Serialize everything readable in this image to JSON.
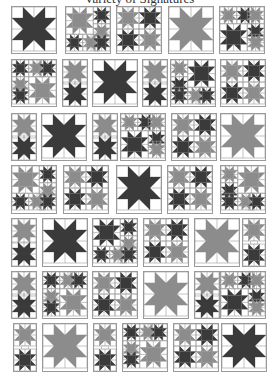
{
  "page": {
    "title": "Variety of Signatures",
    "colors": {
      "dark": "#3a3a3a",
      "medium": "#8c8c8c",
      "light": "#ffffff",
      "grid": "#9a9a9a"
    }
  },
  "blocks": [
    {
      "x": 12,
      "y": 7,
      "w": 44,
      "h": 46,
      "kind": "big",
      "fill": "dark"
    },
    {
      "x": 66,
      "y": 7,
      "w": 44,
      "h": 46,
      "kind": "mixA",
      "fill": "medium"
    },
    {
      "x": 117,
      "y": 7,
      "w": 44,
      "h": 46,
      "kind": "four",
      "fill": "mixed"
    },
    {
      "x": 169,
      "y": 7,
      "w": 44,
      "h": 46,
      "kind": "big",
      "fill": "medium"
    },
    {
      "x": 220,
      "y": 7,
      "w": 44,
      "h": 46,
      "kind": "mixB",
      "fill": "dark"
    },
    {
      "x": 12,
      "y": 60,
      "w": 44,
      "h": 46,
      "kind": "mixC",
      "fill": "medium"
    },
    {
      "x": 63,
      "y": 60,
      "w": 24,
      "h": 46,
      "kind": "tall",
      "fill": "mixed"
    },
    {
      "x": 93,
      "y": 60,
      "w": 44,
      "h": 46,
      "kind": "big",
      "fill": "dark"
    },
    {
      "x": 143,
      "y": 60,
      "w": 24,
      "h": 46,
      "kind": "tall",
      "fill": "mixed"
    },
    {
      "x": 171,
      "y": 60,
      "w": 44,
      "h": 46,
      "kind": "mixD",
      "fill": "dark"
    },
    {
      "x": 221,
      "y": 60,
      "w": 44,
      "h": 46,
      "kind": "four",
      "fill": "mixed"
    },
    {
      "x": 12,
      "y": 114,
      "w": 24,
      "h": 46,
      "kind": "tall",
      "fill": "mixed"
    },
    {
      "x": 42,
      "y": 114,
      "w": 44,
      "h": 46,
      "kind": "big",
      "fill": "dark"
    },
    {
      "x": 93,
      "y": 114,
      "w": 24,
      "h": 46,
      "kind": "tall",
      "fill": "mixed"
    },
    {
      "x": 121,
      "y": 114,
      "w": 44,
      "h": 46,
      "kind": "mixB",
      "fill": "dark"
    },
    {
      "x": 172,
      "y": 114,
      "w": 44,
      "h": 46,
      "kind": "four",
      "fill": "mixed"
    },
    {
      "x": 221,
      "y": 114,
      "w": 44,
      "h": 46,
      "kind": "big",
      "fill": "medium"
    },
    {
      "x": 12,
      "y": 166,
      "w": 44,
      "h": 47,
      "kind": "mixA",
      "fill": "medium"
    },
    {
      "x": 64,
      "y": 166,
      "w": 44,
      "h": 47,
      "kind": "four",
      "fill": "mixed"
    },
    {
      "x": 117,
      "y": 166,
      "w": 44,
      "h": 47,
      "kind": "big",
      "fill": "dark"
    },
    {
      "x": 168,
      "y": 166,
      "w": 44,
      "h": 47,
      "kind": "four",
      "fill": "mixed"
    },
    {
      "x": 221,
      "y": 166,
      "w": 44,
      "h": 47,
      "kind": "mixD",
      "fill": "medium"
    },
    {
      "x": 12,
      "y": 219,
      "w": 24,
      "h": 47,
      "kind": "tall",
      "fill": "mixed"
    },
    {
      "x": 43,
      "y": 219,
      "w": 44,
      "h": 47,
      "kind": "big",
      "fill": "dark"
    },
    {
      "x": 93,
      "y": 219,
      "w": 44,
      "h": 47,
      "kind": "mixA",
      "fill": "dark"
    },
    {
      "x": 144,
      "y": 219,
      "w": 44,
      "h": 47,
      "kind": "four",
      "fill": "mixed"
    },
    {
      "x": 195,
      "y": 219,
      "w": 44,
      "h": 47,
      "kind": "big",
      "fill": "medium"
    },
    {
      "x": 243,
      "y": 219,
      "w": 22,
      "h": 47,
      "kind": "tall",
      "fill": "mixed"
    },
    {
      "x": 12,
      "y": 272,
      "w": 24,
      "h": 46,
      "kind": "tall",
      "fill": "mixed"
    },
    {
      "x": 43,
      "y": 272,
      "w": 44,
      "h": 46,
      "kind": "mixC",
      "fill": "medium"
    },
    {
      "x": 93,
      "y": 272,
      "w": 44,
      "h": 46,
      "kind": "four",
      "fill": "mixed"
    },
    {
      "x": 144,
      "y": 272,
      "w": 44,
      "h": 46,
      "kind": "big",
      "fill": "medium"
    },
    {
      "x": 195,
      "y": 272,
      "w": 24,
      "h": 46,
      "kind": "tall",
      "fill": "mixed"
    },
    {
      "x": 221,
      "y": 272,
      "w": 44,
      "h": 46,
      "kind": "mixB",
      "fill": "dark"
    },
    {
      "x": 14,
      "y": 324,
      "w": 22,
      "h": 47,
      "kind": "tall",
      "fill": "mixed"
    },
    {
      "x": 43,
      "y": 324,
      "w": 44,
      "h": 47,
      "kind": "big",
      "fill": "medium"
    },
    {
      "x": 94,
      "y": 324,
      "w": 22,
      "h": 47,
      "kind": "tall",
      "fill": "mixed"
    },
    {
      "x": 123,
      "y": 324,
      "w": 44,
      "h": 47,
      "kind": "mixC",
      "fill": "medium"
    },
    {
      "x": 174,
      "y": 324,
      "w": 44,
      "h": 47,
      "kind": "four",
      "fill": "mixed"
    },
    {
      "x": 222,
      "y": 324,
      "w": 44,
      "h": 47,
      "kind": "big",
      "fill": "dark"
    }
  ]
}
